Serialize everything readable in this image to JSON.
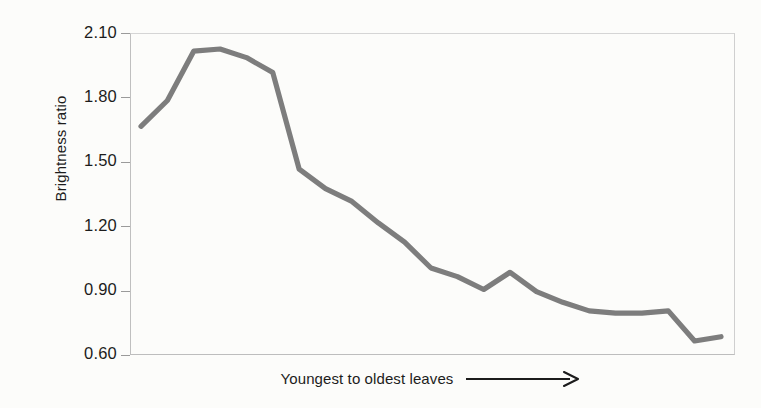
{
  "chart_data": {
    "type": "line",
    "title": "",
    "xlabel": "Youngest to oldest leaves",
    "ylabel": "Brightness ratio",
    "ylim": [
      0.6,
      2.1
    ],
    "yticks": [
      "2.10",
      "1.80",
      "1.50",
      "1.20",
      "0.90",
      "0.60"
    ],
    "ytick_values": [
      2.1,
      1.8,
      1.5,
      1.2,
      0.9,
      0.6
    ],
    "xticks": [],
    "grid": false,
    "legend": null,
    "line_color": "#7d7d7d",
    "series": [
      {
        "name": "Brightness ratio",
        "x": [
          1,
          2,
          3,
          4,
          5,
          6,
          7,
          8,
          9,
          10,
          11,
          12,
          13,
          14,
          15,
          16,
          17,
          18,
          19,
          20,
          21,
          22,
          23
        ],
        "values": [
          1.67,
          1.79,
          2.02,
          2.03,
          1.99,
          1.92,
          1.47,
          1.38,
          1.32,
          1.22,
          1.13,
          1.01,
          0.97,
          0.91,
          0.99,
          0.9,
          0.85,
          0.81,
          0.8,
          0.8,
          0.81,
          0.67,
          0.69
        ]
      }
    ],
    "annotations": [
      {
        "name": "x-axis-arrow",
        "description": "rightward arrow following x axis caption"
      }
    ]
  },
  "axis": {
    "y_title": "Brightness ratio",
    "x_caption": "Youngest to oldest leaves",
    "tick_labels": [
      "2.10",
      "1.80",
      "1.50",
      "1.20",
      "0.90",
      "0.60"
    ]
  }
}
